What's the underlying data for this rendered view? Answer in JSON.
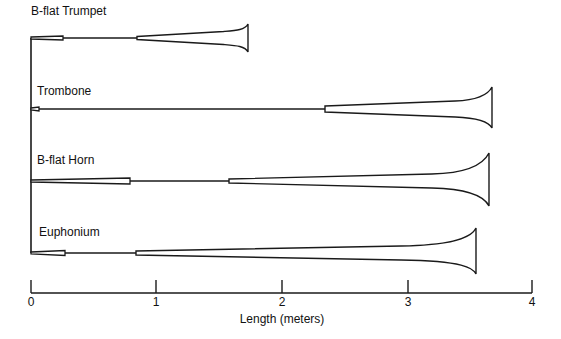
{
  "instruments": [
    {
      "name": "B-flat Trumpet",
      "label_x": 31,
      "label_y": 4,
      "y": 38,
      "mouthpiece_end": 63,
      "mouthpiece_h": 4,
      "cone_start": 137,
      "cone_h": 5,
      "bell_x": 248,
      "bell_top": 24,
      "bell_bottom": 52
    },
    {
      "name": "Trombone",
      "label_x": 37,
      "label_y": 84,
      "y": 109,
      "mouthpiece_end": 39,
      "mouthpiece_h": 4,
      "cone_start": 325,
      "cone_h": 8,
      "bell_x": 492,
      "bell_top": 87,
      "bell_bottom": 128
    },
    {
      "name": "B-flat Horn",
      "label_x": 37,
      "label_y": 153,
      "y": 181,
      "mouthpiece_end": 130,
      "mouthpiece_h": 6,
      "cone_start": 229,
      "cone_h": 6,
      "bell_x": 489,
      "bell_top": 153,
      "bell_bottom": 206
    },
    {
      "name": "Euphonium",
      "label_x": 39,
      "label_y": 225,
      "y": 253,
      "mouthpiece_end": 65,
      "mouthpiece_h": 5,
      "cone_start": 136,
      "cone_h": 6,
      "bell_x": 476,
      "bell_top": 228,
      "bell_bottom": 274
    }
  ],
  "axis": {
    "title": "Length (meters)",
    "ticks": [
      {
        "label": "0",
        "x": 31
      },
      {
        "label": "1",
        "x": 156
      },
      {
        "label": "2",
        "x": 282
      },
      {
        "label": "3",
        "x": 408
      },
      {
        "label": "4",
        "x": 532
      }
    ],
    "y": 293
  },
  "stroke_color": "#1a1a1a"
}
